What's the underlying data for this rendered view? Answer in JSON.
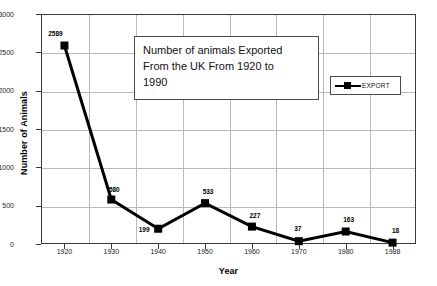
{
  "chart_data": {
    "type": "line",
    "title": "Number of animals Exported From the UK From 1920 to 1990",
    "title_lines": [
      "Number of animals Exported",
      "From the UK From 1920 to",
      "1990"
    ],
    "xlabel": "Year",
    "ylabel": "Number of Animals",
    "categories": [
      "1920",
      "1930",
      "1940",
      "1950",
      "1960",
      "1970",
      "1980",
      "1988"
    ],
    "values": [
      2589,
      580,
      199,
      533,
      227,
      37,
      163,
      18
    ],
    "point_labels": [
      "2589",
      "580",
      "199",
      "533",
      "227",
      "37",
      "163",
      "18"
    ],
    "series": [
      {
        "name": "EXPORT",
        "values": [
          2589,
          580,
          199,
          533,
          227,
          37,
          163,
          18
        ]
      }
    ],
    "ylim": [
      0,
      3000
    ],
    "yticks": [
      "0",
      "500",
      "1000",
      "1500",
      "2000",
      "2500",
      "3000"
    ],
    "ytick_values": [
      0,
      500,
      1000,
      1500,
      2000,
      2500,
      3000
    ],
    "grid": true,
    "legend_position": "upper right",
    "legend_entries": [
      "EXPORT"
    ],
    "colors": {
      "series_line": "#000000",
      "marker": "#000000",
      "gridline": "#b9b9b9",
      "frame": "#3a3a3a",
      "background": "#ffffff",
      "text": "#000000"
    }
  },
  "legend": {
    "label": "EXPORT",
    "marker_icon": "square-marker-icon"
  }
}
